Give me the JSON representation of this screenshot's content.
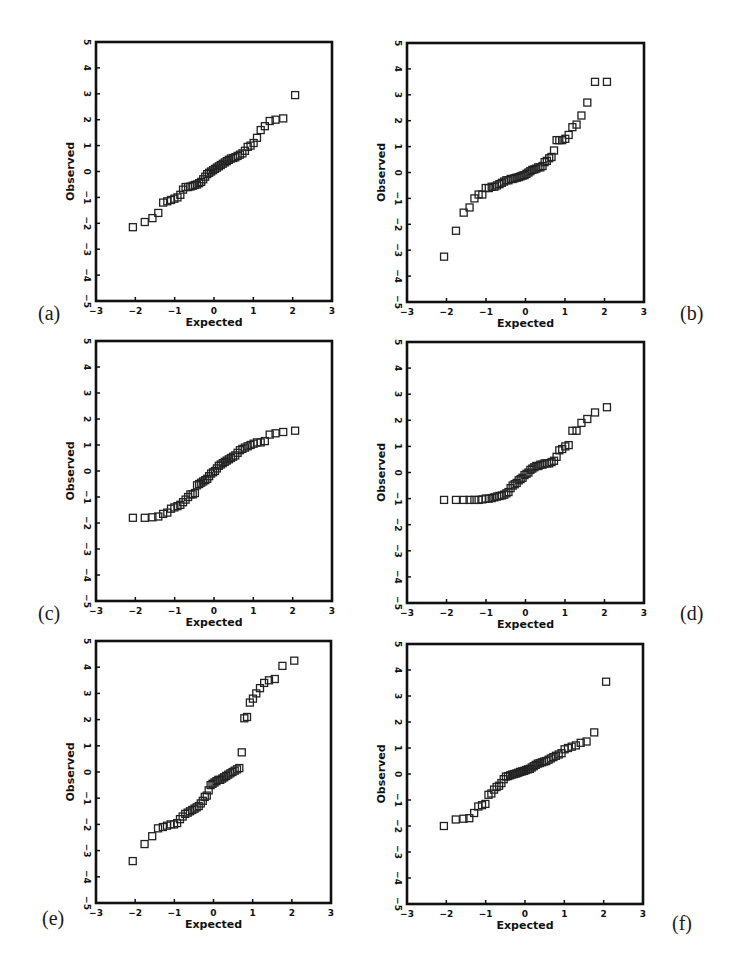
{
  "figure": {
    "panels": [
      {
        "id": "a",
        "label": "(a)"
      },
      {
        "id": "b",
        "label": "(b)"
      },
      {
        "id": "c",
        "label": "(c)"
      },
      {
        "id": "d",
        "label": "(d)"
      },
      {
        "id": "e",
        "label": "(e)"
      },
      {
        "id": "f",
        "label": "(f)"
      }
    ],
    "xlabel": "Expected",
    "ylabel": "Observed",
    "x_ticks": [
      "-3",
      "-2",
      "-1",
      "0",
      "1",
      "2",
      "3"
    ],
    "y_ticks": [
      "-5",
      "-4",
      "-3",
      "-2",
      "-1",
      "0",
      "1",
      "2",
      "3",
      "4",
      "5"
    ],
    "colors": {
      "axis": "#111111",
      "marker": "#222222",
      "background": "#ffffff"
    }
  },
  "chart_data": [
    {
      "type": "scatter",
      "panel": "(a)",
      "title": "",
      "xlabel": "Expected",
      "ylabel": "Observed",
      "xlim": [
        -3,
        3
      ],
      "ylim": [
        -5,
        5
      ],
      "grid": false,
      "marker": "open-square",
      "x": [
        -2.062,
        -1.76,
        -1.565,
        -1.416,
        -1.293,
        -1.187,
        -1.093,
        -1.007,
        -0.929,
        -0.856,
        -0.787,
        -0.722,
        -0.659,
        -0.6,
        -0.541,
        -0.485,
        -0.431,
        -0.377,
        -0.325,
        -0.274,
        -0.223,
        -0.172,
        -0.123,
        -0.074,
        -0.025,
        0.025,
        0.074,
        0.123,
        0.172,
        0.223,
        0.274,
        0.325,
        0.377,
        0.431,
        0.485,
        0.541,
        0.6,
        0.659,
        0.722,
        0.787,
        0.856,
        0.929,
        1.007,
        1.093,
        1.187,
        1.293,
        1.416,
        1.565,
        1.76,
        2.062
      ],
      "y": [
        -2.15,
        -1.95,
        -1.8,
        -1.6,
        -1.2,
        -1.15,
        -1.1,
        -1.05,
        -1.0,
        -0.9,
        -0.7,
        -0.6,
        -0.6,
        -0.58,
        -0.55,
        -0.52,
        -0.5,
        -0.45,
        -0.4,
        -0.3,
        -0.2,
        -0.1,
        -0.05,
        0.0,
        0.05,
        0.1,
        0.15,
        0.2,
        0.25,
        0.3,
        0.35,
        0.4,
        0.45,
        0.5,
        0.52,
        0.55,
        0.6,
        0.65,
        0.7,
        0.8,
        0.95,
        1.0,
        1.1,
        1.3,
        1.6,
        1.75,
        1.95,
        2.0,
        2.05,
        2.95
      ]
    },
    {
      "type": "scatter",
      "panel": "(b)",
      "title": "",
      "xlabel": "Expected",
      "ylabel": "Observed",
      "xlim": [
        -3,
        3
      ],
      "ylim": [
        -5,
        5
      ],
      "grid": false,
      "marker": "open-square",
      "x": [
        -2.062,
        -1.76,
        -1.565,
        -1.416,
        -1.293,
        -1.187,
        -1.093,
        -1.007,
        -0.929,
        -0.856,
        -0.787,
        -0.722,
        -0.659,
        -0.6,
        -0.541,
        -0.485,
        -0.431,
        -0.377,
        -0.325,
        -0.274,
        -0.223,
        -0.172,
        -0.123,
        -0.074,
        -0.025,
        0.025,
        0.074,
        0.123,
        0.172,
        0.223,
        0.274,
        0.325,
        0.377,
        0.431,
        0.485,
        0.541,
        0.6,
        0.659,
        0.722,
        0.787,
        0.856,
        0.929,
        1.007,
        1.093,
        1.187,
        1.293,
        1.416,
        1.565,
        1.76,
        2.062
      ],
      "y": [
        -3.25,
        -2.25,
        -1.55,
        -1.35,
        -1.0,
        -0.85,
        -0.85,
        -0.6,
        -0.6,
        -0.55,
        -0.55,
        -0.5,
        -0.45,
        -0.4,
        -0.35,
        -0.3,
        -0.3,
        -0.25,
        -0.25,
        -0.22,
        -0.2,
        -0.18,
        -0.15,
        -0.12,
        -0.1,
        -0.05,
        0.0,
        0.05,
        0.1,
        0.12,
        0.15,
        0.2,
        0.2,
        0.25,
        0.4,
        0.45,
        0.55,
        0.6,
        0.85,
        1.25,
        1.25,
        1.25,
        1.3,
        1.45,
        1.75,
        1.85,
        2.2,
        2.7,
        3.5,
        3.5
      ]
    },
    {
      "type": "scatter",
      "panel": "(c)",
      "title": "",
      "xlabel": "Expected",
      "ylabel": "Observed",
      "xlim": [
        -3,
        3
      ],
      "ylim": [
        -5,
        5
      ],
      "grid": false,
      "marker": "open-square",
      "x": [
        -2.062,
        -1.76,
        -1.565,
        -1.416,
        -1.293,
        -1.187,
        -1.093,
        -1.007,
        -0.929,
        -0.856,
        -0.787,
        -0.722,
        -0.659,
        -0.6,
        -0.541,
        -0.485,
        -0.431,
        -0.377,
        -0.325,
        -0.274,
        -0.223,
        -0.172,
        -0.123,
        -0.074,
        -0.025,
        0.025,
        0.074,
        0.123,
        0.172,
        0.223,
        0.274,
        0.325,
        0.377,
        0.431,
        0.485,
        0.541,
        0.6,
        0.659,
        0.722,
        0.787,
        0.856,
        0.929,
        1.007,
        1.093,
        1.187,
        1.293,
        1.416,
        1.565,
        1.76,
        2.062
      ],
      "y": [
        -1.8,
        -1.8,
        -1.78,
        -1.75,
        -1.65,
        -1.6,
        -1.45,
        -1.4,
        -1.35,
        -1.3,
        -1.2,
        -1.1,
        -1.0,
        -0.9,
        -0.9,
        -0.85,
        -0.55,
        -0.5,
        -0.45,
        -0.4,
        -0.35,
        -0.3,
        -0.2,
        -0.1,
        -0.05,
        0.0,
        0.1,
        0.2,
        0.25,
        0.3,
        0.35,
        0.4,
        0.45,
        0.5,
        0.55,
        0.6,
        0.7,
        0.8,
        0.85,
        0.9,
        0.95,
        1.0,
        1.05,
        1.1,
        1.1,
        1.15,
        1.4,
        1.45,
        1.5,
        1.55
      ]
    },
    {
      "type": "scatter",
      "panel": "(d)",
      "title": "",
      "xlabel": "Expected",
      "ylabel": "Observed",
      "xlim": [
        -3,
        3
      ],
      "ylim": [
        -5,
        5
      ],
      "grid": false,
      "marker": "open-square",
      "x": [
        -2.062,
        -1.76,
        -1.565,
        -1.416,
        -1.293,
        -1.187,
        -1.093,
        -1.007,
        -0.929,
        -0.856,
        -0.787,
        -0.722,
        -0.659,
        -0.6,
        -0.541,
        -0.485,
        -0.431,
        -0.377,
        -0.325,
        -0.274,
        -0.223,
        -0.172,
        -0.123,
        -0.074,
        -0.025,
        0.025,
        0.074,
        0.123,
        0.172,
        0.223,
        0.274,
        0.325,
        0.377,
        0.431,
        0.485,
        0.541,
        0.6,
        0.659,
        0.722,
        0.787,
        0.856,
        0.929,
        1.007,
        1.093,
        1.187,
        1.293,
        1.416,
        1.565,
        1.76,
        2.062
      ],
      "y": [
        -1.05,
        -1.05,
        -1.05,
        -1.05,
        -1.05,
        -1.05,
        -1.03,
        -1.0,
        -1.0,
        -0.98,
        -0.95,
        -0.92,
        -0.9,
        -0.88,
        -0.85,
        -0.8,
        -0.75,
        -0.6,
        -0.5,
        -0.45,
        -0.4,
        -0.3,
        -0.25,
        -0.2,
        -0.1,
        -0.05,
        0.0,
        0.1,
        0.15,
        0.2,
        0.25,
        0.25,
        0.3,
        0.3,
        0.35,
        0.35,
        0.35,
        0.4,
        0.45,
        0.6,
        0.85,
        0.9,
        1.0,
        1.05,
        1.6,
        1.6,
        1.9,
        2.05,
        2.3,
        2.5
      ]
    },
    {
      "type": "scatter",
      "panel": "(e)",
      "title": "",
      "xlabel": "Expected",
      "ylabel": "Observed",
      "xlim": [
        -3,
        3
      ],
      "ylim": [
        -5,
        5
      ],
      "grid": false,
      "marker": "open-square",
      "x": [
        -2.062,
        -1.76,
        -1.565,
        -1.416,
        -1.293,
        -1.187,
        -1.093,
        -1.007,
        -0.929,
        -0.856,
        -0.787,
        -0.722,
        -0.659,
        -0.6,
        -0.541,
        -0.485,
        -0.431,
        -0.377,
        -0.325,
        -0.274,
        -0.223,
        -0.172,
        -0.123,
        -0.074,
        -0.025,
        0.025,
        0.074,
        0.123,
        0.172,
        0.223,
        0.274,
        0.325,
        0.377,
        0.431,
        0.485,
        0.541,
        0.6,
        0.659,
        0.722,
        0.787,
        0.856,
        0.929,
        1.007,
        1.093,
        1.187,
        1.293,
        1.416,
        1.565,
        1.76,
        2.062
      ],
      "y": [
        -3.4,
        -2.75,
        -2.45,
        -2.15,
        -2.1,
        -2.05,
        -2.0,
        -2.0,
        -1.95,
        -1.8,
        -1.7,
        -1.6,
        -1.55,
        -1.5,
        -1.45,
        -1.4,
        -1.35,
        -1.3,
        -1.2,
        -1.1,
        -0.95,
        -0.9,
        -0.7,
        -0.5,
        -0.45,
        -0.4,
        -0.35,
        -0.3,
        -0.3,
        -0.25,
        -0.2,
        -0.15,
        -0.1,
        -0.05,
        0.0,
        0.05,
        0.1,
        0.15,
        0.75,
        2.05,
        2.1,
        2.65,
        2.8,
        3.0,
        3.2,
        3.4,
        3.5,
        3.55,
        4.05,
        4.25
      ]
    },
    {
      "type": "scatter",
      "panel": "(f)",
      "title": "",
      "xlabel": "Expected",
      "ylabel": "Observed",
      "xlim": [
        -3,
        3
      ],
      "ylim": [
        -5,
        5
      ],
      "grid": false,
      "marker": "open-square",
      "x": [
        -2.062,
        -1.76,
        -1.565,
        -1.416,
        -1.293,
        -1.187,
        -1.093,
        -1.007,
        -0.929,
        -0.856,
        -0.787,
        -0.722,
        -0.659,
        -0.6,
        -0.541,
        -0.485,
        -0.431,
        -0.377,
        -0.325,
        -0.274,
        -0.223,
        -0.172,
        -0.123,
        -0.074,
        -0.025,
        0.025,
        0.074,
        0.123,
        0.172,
        0.223,
        0.274,
        0.325,
        0.377,
        0.431,
        0.485,
        0.541,
        0.6,
        0.659,
        0.722,
        0.787,
        0.856,
        0.929,
        1.007,
        1.093,
        1.187,
        1.293,
        1.416,
        1.565,
        1.76,
        2.062
      ],
      "y": [
        -2.0,
        -1.75,
        -1.72,
        -1.7,
        -1.5,
        -1.25,
        -1.2,
        -1.15,
        -0.8,
        -0.75,
        -0.6,
        -0.5,
        -0.45,
        -0.35,
        -0.2,
        -0.1,
        -0.08,
        -0.05,
        -0.02,
        0.0,
        0.02,
        0.05,
        0.08,
        0.1,
        0.12,
        0.15,
        0.18,
        0.2,
        0.25,
        0.3,
        0.35,
        0.4,
        0.42,
        0.45,
        0.48,
        0.5,
        0.55,
        0.6,
        0.65,
        0.7,
        0.75,
        0.8,
        0.95,
        1.0,
        1.05,
        1.1,
        1.2,
        1.25,
        1.6,
        3.55
      ]
    }
  ]
}
